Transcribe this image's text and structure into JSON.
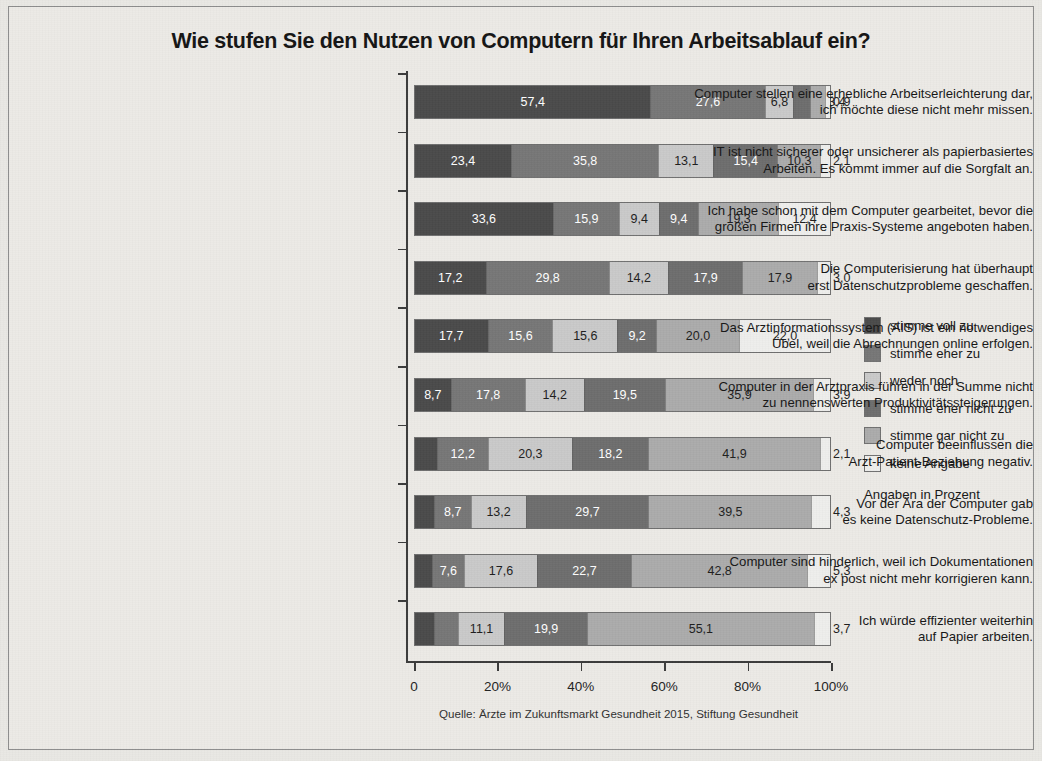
{
  "chart_data": {
    "type": "bar",
    "orientation": "horizontal",
    "stacked": true,
    "normalized_percent": true,
    "title": "Wie stufen Sie den Nutzen von Computern für Ihren Arbeitsablauf ein?",
    "xlabel": "",
    "ylabel": "",
    "xlim": [
      0,
      100
    ],
    "xticks": [
      0,
      20,
      40,
      60,
      80,
      100
    ],
    "xticklabels": [
      "0",
      "20%",
      "40%",
      "60%",
      "80%",
      "100%"
    ],
    "grid": false,
    "legend_position": "right",
    "legend_note": "Angaben in Prozent",
    "source": "Quelle: Ärzte im Zukunftsmarkt Gesundheit 2015, Stiftung Gesundheit",
    "series": [
      {
        "name": "stimme voll zu",
        "color": "#4a4a4a",
        "label_color": "#ffffff"
      },
      {
        "name": "stimme eher zu",
        "color": "#767676",
        "label_color": "#ffffff"
      },
      {
        "name": "weder noch",
        "color": "#c9c9c9",
        "label_color": "#1d1d1d"
      },
      {
        "name": "stimme eher nicht zu",
        "color": "#6d6d6d",
        "label_color": "#ffffff"
      },
      {
        "name": "stimme gar nicht zu",
        "color": "#ababab",
        "label_color": "#1d1d1d"
      },
      {
        "name": "keine Angabe",
        "color": "#eeeeec",
        "label_color": "#1d1d1d"
      }
    ],
    "categories": [
      "Computer stellen eine erhebliche Arbeitserleichterung dar, ich möchte diese nicht mehr missen.",
      "IT ist nicht sicherer oder unsicherer als papierbasiertes Arbeiten. Es kommt immer auf die Sorgfalt an.",
      "Ich habe schon mit dem Computer gearbeitet, bevor die großen Firmen ihre Praxis-Systeme angeboten haben.",
      "Die Computerisierung hat überhaupt erst Datenschutzprobleme geschaffen.",
      "Das Arztinformationssystem (AIS) ist ein notwendiges Übel, weil die Abrechnungen online erfolgen.",
      "Computer in der Arztpraxis führen in der Summe nicht zu nennenswerten Produktivitätssteigerungen.",
      "Computer beeinflussen die Arzt-Patient-Beziehung negativ.",
      "Vor der Ära der Computer gab es keine Datenschutz-Probleme.",
      "Computer sind hinderlich, weil ich Dokumentationen ex post nicht mehr korrigieren kann.",
      "Ich würde effizienter weiterhin auf Papier arbeiten."
    ],
    "category_lines": [
      [
        "Computer stellen eine erhebliche Arbeitserleichterung dar,",
        "ich möchte diese nicht mehr missen."
      ],
      [
        "IT ist nicht sicherer oder unsicherer als papierbasiertes",
        "Arbeiten. Es kommt immer auf die Sorgfalt an."
      ],
      [
        "Ich habe schon mit dem Computer gearbeitet, bevor die",
        "großen Firmen ihre Praxis-Systeme angeboten haben."
      ],
      [
        "Die Computerisierung hat überhaupt",
        "erst Datenschutzprobleme geschaffen."
      ],
      [
        "Das Arztinformationssystem (AIS) ist ein notwendiges",
        "Übel, weil die Abrechnungen online erfolgen."
      ],
      [
        "Computer in der Arztpraxis führen in der Summe nicht",
        "zu nennenswerten Produktivitätssteigerungen."
      ],
      [
        "Computer beeinflussen die",
        "Arzt-Patient-Beziehung negativ."
      ],
      [
        "Vor der Ära der Computer gab",
        "es keine Datenschutz-Probleme."
      ],
      [
        "Computer sind hinderlich, weil ich Dokumentationen",
        "ex post nicht mehr korrigieren kann."
      ],
      [
        "Ich würde effizienter weiterhin",
        "auf Papier arbeiten."
      ]
    ],
    "values": [
      [
        57.4,
        27.6,
        6.8,
        3.9,
        3.4,
        0.9
      ],
      [
        23.4,
        35.8,
        13.1,
        15.4,
        10.3,
        2.1
      ],
      [
        33.6,
        15.9,
        9.4,
        9.4,
        19.3,
        12.4
      ],
      [
        17.2,
        29.8,
        14.2,
        17.9,
        17.9,
        3.0
      ],
      [
        17.7,
        15.6,
        15.6,
        9.2,
        20.0,
        22.0
      ],
      [
        8.7,
        17.8,
        14.2,
        19.5,
        35.9,
        3.9
      ],
      [
        5.3,
        12.2,
        20.3,
        18.2,
        41.9,
        2.1
      ],
      [
        4.6,
        8.7,
        13.2,
        29.7,
        39.5,
        4.3
      ],
      [
        4.1,
        7.6,
        17.6,
        22.7,
        42.8,
        5.3
      ],
      [
        4.6,
        5.6,
        11.1,
        19.9,
        55.1,
        3.7
      ]
    ],
    "value_labels": [
      [
        "57,4",
        "27,6",
        "6,8",
        "3,9",
        "3,4",
        "0,9"
      ],
      [
        "23,4",
        "35,8",
        "13,1",
        "15,4",
        "10,3",
        "2,1"
      ],
      [
        "33,6",
        "15,9",
        "9,4",
        "9,4",
        "19,3",
        "12,4"
      ],
      [
        "17,2",
        "29,8",
        "14,2",
        "17,9",
        "17,9",
        "3,0"
      ],
      [
        "17,7",
        "15,6",
        "15,6",
        "9,2",
        "20,0",
        "22,0"
      ],
      [
        "8,7",
        "17,8",
        "14,2",
        "19,5",
        "35,9",
        "3,9"
      ],
      [
        "5,3",
        "12,2",
        "20,3",
        "18,2",
        "41,9",
        "2,1"
      ],
      [
        "4,6",
        "8,7",
        "13,2",
        "29,7",
        "39,5",
        "4,3"
      ],
      [
        "4,1",
        "7,6",
        "17,6",
        "22,7",
        "42,8",
        "5,3"
      ],
      [
        "4,6",
        "5,6",
        "11,1",
        "19,9",
        "55,1",
        "3,7"
      ]
    ]
  }
}
